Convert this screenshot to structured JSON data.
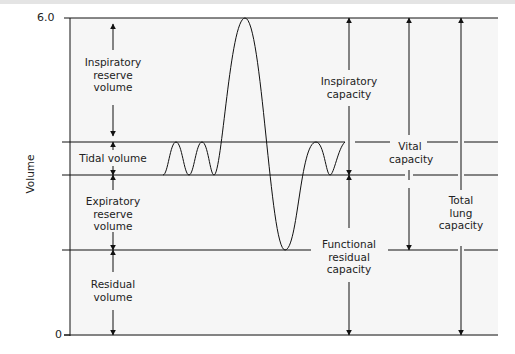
{
  "diagram": {
    "y_axis": {
      "label": "Volume",
      "ticks": [
        "6.0",
        "0"
      ]
    },
    "volumes": [
      {
        "name": "inspiratory-reserve-volume",
        "label": "Inspiratory\nreserve\nvolume"
      },
      {
        "name": "tidal-volume",
        "label": "Tidal volume"
      },
      {
        "name": "expiratory-reserve-volume",
        "label": "Expiratory\nreserve\nvolume"
      },
      {
        "name": "residual-volume",
        "label": "Residual\nvolume"
      }
    ],
    "capacities": [
      {
        "name": "inspiratory-capacity",
        "label": "Inspiratory\ncapacity"
      },
      {
        "name": "functional-residual-capacity",
        "label": "Functional\nresidual\ncapacity"
      },
      {
        "name": "vital-capacity",
        "label": "Vital\ncapacity"
      },
      {
        "name": "total-lung-capacity",
        "label": "Total\nlung\ncapacity"
      }
    ],
    "colors": {
      "line": "#111111",
      "panel": "#f6f6f6",
      "text": "#222222"
    }
  }
}
